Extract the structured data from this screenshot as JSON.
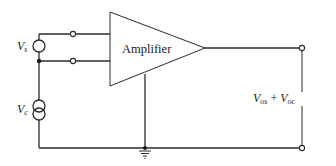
{
  "diagram": {
    "type": "circuit-schematic",
    "amplifier": {
      "label": "Amplifier"
    },
    "sources": [
      {
        "id": "Vs",
        "symbol": "V",
        "subscript": "s",
        "kind": "voltage-source"
      },
      {
        "id": "Vc",
        "symbol": "V",
        "subscript": "c",
        "kind": "dependent/current-source"
      }
    ],
    "output": {
      "label_parts": [
        {
          "symbol": "V",
          "subscript": "os"
        },
        {
          "operator": "+"
        },
        {
          "symbol": "V",
          "subscript": "oc"
        }
      ]
    },
    "ground": {
      "label": "ground"
    }
  }
}
